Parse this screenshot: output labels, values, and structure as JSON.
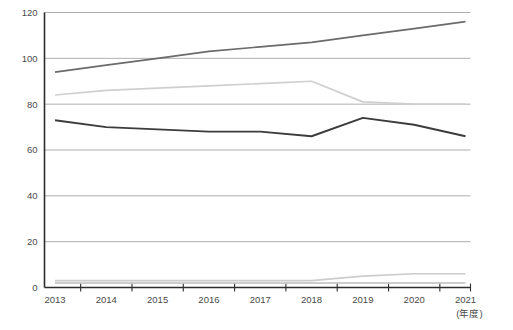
{
  "chart_data": {
    "type": "line",
    "title": "",
    "xlabel": "(年度)",
    "ylabel": "",
    "categories": [
      "2013",
      "2014",
      "2015",
      "2016",
      "2017",
      "2018",
      "2019",
      "2020",
      "2021"
    ],
    "x": [
      2013,
      2014,
      2015,
      2016,
      2017,
      2018,
      2019,
      2020,
      2021
    ],
    "ylim": [
      0,
      120
    ],
    "yticks": [
      0,
      20,
      40,
      60,
      80,
      100,
      120
    ],
    "ytick_labels": [
      "0",
      "20",
      "40",
      "60",
      "80",
      "100",
      "120"
    ],
    "grid": true,
    "grid_axis": "y",
    "legend": "none",
    "series": [
      {
        "name": "series-1",
        "color": "#6b6b6b",
        "width": 1.7,
        "values": [
          94,
          97,
          100,
          103,
          105,
          107,
          110,
          113,
          116
        ]
      },
      {
        "name": "series-2",
        "color": "#cfcfcf",
        "width": 1.7,
        "values": [
          84,
          86,
          87,
          88,
          89,
          90,
          81,
          80,
          80
        ]
      },
      {
        "name": "series-3",
        "color": "#3c3c3c",
        "width": 1.9,
        "values": [
          73,
          70,
          69,
          68,
          68,
          66,
          74,
          71,
          66
        ]
      },
      {
        "name": "series-4",
        "color": "#bdbdbd",
        "width": 1.5,
        "values": [
          2,
          2,
          2,
          2,
          2,
          2,
          2,
          2,
          2
        ]
      },
      {
        "name": "series-5",
        "color": "#cccccc",
        "width": 1.7,
        "values": [
          3,
          3,
          3,
          3,
          3,
          3,
          5,
          6,
          6
        ]
      }
    ]
  },
  "axis": {
    "unit_label": "(年度)",
    "y_axis_name": "y-axis",
    "x_axis_name": "x-axis"
  },
  "colors": {
    "gridline": "#9a9a9a",
    "axis": "#2d2d2d",
    "text": "#4a4a4a",
    "background": "#ffffff"
  }
}
